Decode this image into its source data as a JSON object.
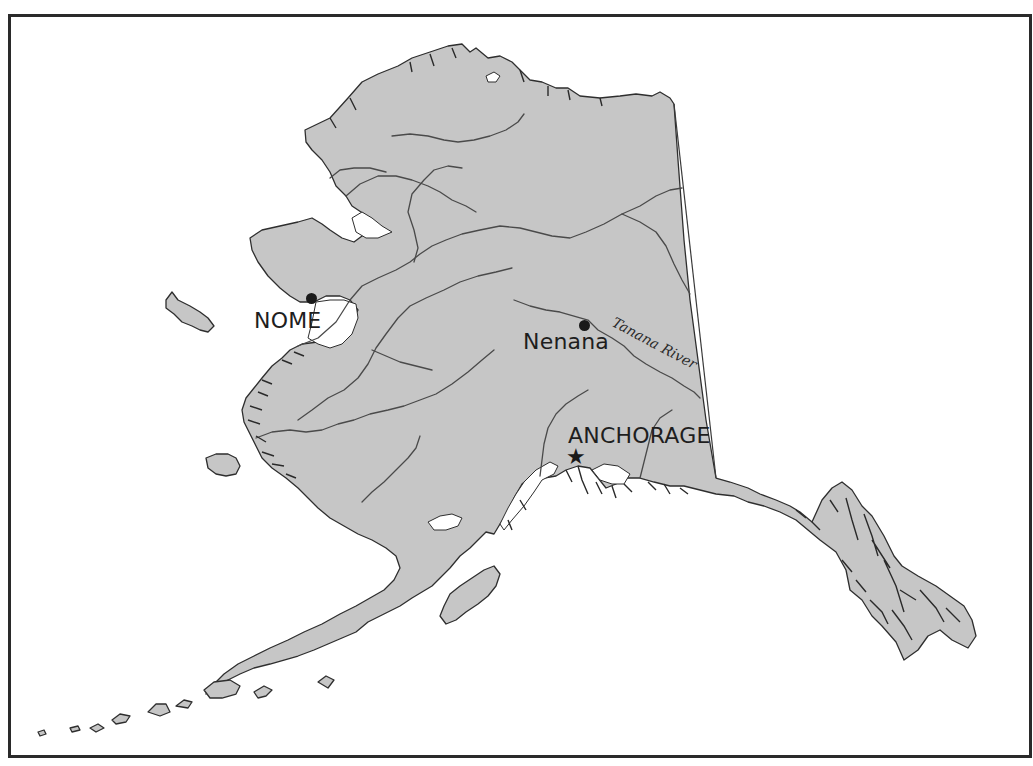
{
  "map": {
    "title": "",
    "region": "Alaska",
    "colors": {
      "land": "#c6c6c6",
      "coastline": "#2e2e2e",
      "rivers": "#4a4a4a",
      "water": "#ffffff",
      "frame": "#2a2a2a",
      "labels": "#1e1e1e"
    },
    "places": [
      {
        "id": "nome",
        "label": "NOME",
        "marker": "dot",
        "x": 311,
        "y": 298
      },
      {
        "id": "nenana",
        "label": "Nenana",
        "marker": "dot",
        "x": 584,
        "y": 326
      },
      {
        "id": "anchorage",
        "label": "ANCHORAGE",
        "marker": "star",
        "x": 577,
        "y": 457
      }
    ],
    "rivers": [
      {
        "id": "tanana",
        "label": "Tanana River"
      }
    ]
  }
}
